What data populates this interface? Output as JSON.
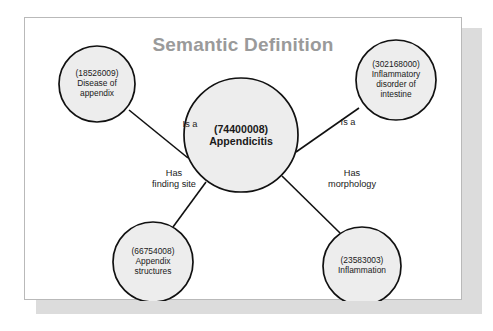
{
  "page": {
    "title": "Semantic Definition",
    "title_color": "#9a9a9a",
    "card_background": "#ffffff",
    "card_border_color": "#b9b9b9",
    "shadow_color": "#dcdcdc"
  },
  "diagram": {
    "type": "concept-graph",
    "node_fill": "#ededed",
    "node_stroke": "#111111",
    "edge_stroke": "#111111",
    "center_node": {
      "id": "appendicitis",
      "code": "(74400008)",
      "label": "Appendicitis",
      "text": "(74400008)\nAppendicitis",
      "cx": 216,
      "cy": 117,
      "r": 57
    },
    "nodes": [
      {
        "id": "disease-of-appendix",
        "code": "(18526009)",
        "label": "Disease of appendix",
        "text": "(18526009)\nDisease of\nappendix",
        "cx": 72,
        "cy": 66,
        "r": 38
      },
      {
        "id": "inflammatory-disorder-of-intestine",
        "code": "(302168000)",
        "label": "Inflammatory disorder of intestine",
        "text": "(302168000)\nInflammatory\ndisorder of\nintestine",
        "cx": 371,
        "cy": 62,
        "r": 40
      },
      {
        "id": "appendix-structures",
        "code": "(66754008)",
        "label": "Appendix structures",
        "text": "(66754008)\nAppendix\nstructures",
        "cx": 128,
        "cy": 244,
        "r": 40
      },
      {
        "id": "inflammation",
        "code": "(23583003)",
        "label": "Inflammation",
        "text": "(23583003)\nInflammation",
        "cx": 337,
        "cy": 248,
        "r": 39
      }
    ],
    "edges": [
      {
        "id": "edge-is-a-left",
        "label": "Is a",
        "from": "appendicitis",
        "to": "disease-of-appendix",
        "x1": 163,
        "y1": 140,
        "x2": 104,
        "y2": 92,
        "label_x": 129,
        "label_y": 101
      },
      {
        "id": "edge-is-a-right",
        "label": "Is a",
        "from": "appendicitis",
        "to": "inflammatory-disorder-of-intestine",
        "x1": 271,
        "y1": 134,
        "x2": 334,
        "y2": 90,
        "label_x": 287,
        "label_y": 99
      },
      {
        "id": "edge-has-finding-site",
        "label": "Has finding site",
        "text": "Has\nfinding site",
        "from": "appendicitis",
        "to": "appendix-structures",
        "x1": 181,
        "y1": 164,
        "x2": 148,
        "y2": 209,
        "label_x": 113,
        "label_y": 150
      },
      {
        "id": "edge-has-morphology",
        "label": "Has morphology",
        "text": "Has\nmorphology",
        "from": "appendicitis",
        "to": "inflammation",
        "x1": 257,
        "y1": 158,
        "x2": 315,
        "y2": 215,
        "label_x": 291,
        "label_y": 150
      }
    ]
  }
}
